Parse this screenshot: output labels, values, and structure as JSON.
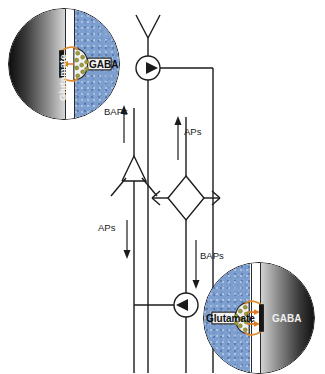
{
  "figure": {
    "type": "neural-circuit-schematic",
    "background": "#ffffff",
    "width": 325,
    "height": 373
  },
  "colors": {
    "ink": "#1b1b1b",
    "presynaptic_blue": "#7d9fd0",
    "postsynaptic_gray_dark": "#0d0d0d",
    "postsynaptic_gray_light": "#d6d6d6",
    "receptor_orange": "#e08a2e",
    "vesicle_olive": "#9a9a3c",
    "cleft_white": "#ffffff",
    "arrow_orange": "#e07a1e"
  },
  "circuit": {
    "nodes": [
      {
        "id": "interneuron-top",
        "name": "inhibitory-interneuron-top",
        "shape": "circle-with-right-triangle",
        "cx": 148,
        "cy": 68,
        "r": 12,
        "direction": "right"
      },
      {
        "id": "pyramidal-neuron",
        "name": "pyramidal-neuron-soma",
        "shape": "triangle-up",
        "cx": 134,
        "cy": 168,
        "size": 25
      },
      {
        "id": "stellate-neuron",
        "name": "stellate-neuron-soma",
        "shape": "diamond",
        "cx": 186,
        "cy": 198,
        "size": 22
      },
      {
        "id": "interneuron-bottom",
        "name": "inhibitory-interneuron-bottom",
        "shape": "circle-with-left-triangle",
        "cx": 186,
        "cy": 305,
        "r": 12,
        "direction": "left"
      }
    ],
    "signal_labels": [
      {
        "id": "baps-top",
        "text": "BAPs",
        "x": 106,
        "y": 112,
        "arrow": "up",
        "arrow_x": 124,
        "arrow_y0": 143,
        "arrow_y1": 108
      },
      {
        "id": "aps-right",
        "text": "APs",
        "x": 195,
        "y": 133,
        "arrow": "up",
        "arrow_x": 186,
        "arrow_y0": 160,
        "arrow_y1": 117
      },
      {
        "id": "aps-left",
        "text": "APs",
        "x": 106,
        "y": 228,
        "arrow": "down",
        "arrow_x": 134,
        "arrow_y0": 218,
        "arrow_y1": 258
      },
      {
        "id": "baps-bottom",
        "text": "BAPs",
        "x": 195,
        "y": 256,
        "arrow": "down",
        "arrow_x": 186,
        "arrow_y0": 240,
        "arrow_y1": 288
      }
    ]
  },
  "insets": [
    {
      "id": "inset-top-left",
      "name": "synapse-inset-top-left",
      "x": 8,
      "y": 8,
      "size": 112,
      "orientation": "postsynaptic-left",
      "labels": {
        "presynaptic": "GABA",
        "postsynaptic": "Glutamate"
      },
      "vesicle_count": 9,
      "description": "GABAergic presynaptic terminal (blue) releasing onto a glutamatergic dendrite (gray), receptors in orange"
    },
    {
      "id": "inset-bottom-right",
      "name": "synapse-inset-bottom-right",
      "x": 203,
      "y": 262,
      "size": 112,
      "orientation": "postsynaptic-right",
      "labels": {
        "presynaptic": "Glutamate",
        "postsynaptic": "GABA"
      },
      "vesicle_count": 9,
      "description": "Glutamatergic presynaptic terminal (blue) releasing onto a GABAergic dendrite (gray), receptors in orange"
    }
  ]
}
